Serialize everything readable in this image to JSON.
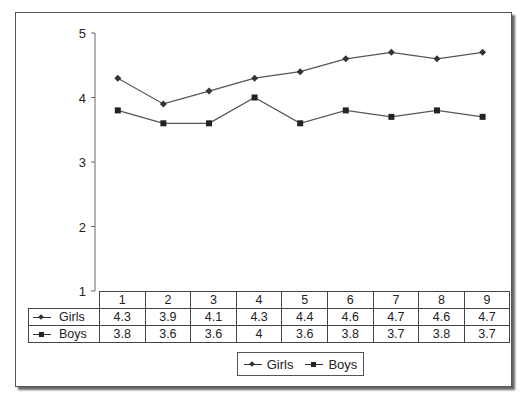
{
  "chart_data": {
    "type": "line",
    "title": "",
    "xlabel": "",
    "ylabel": "",
    "ylim": [
      1,
      5
    ],
    "yticks": [
      1,
      2,
      3,
      4,
      5
    ],
    "categories": [
      "1",
      "2",
      "3",
      "4",
      "5",
      "6",
      "7",
      "8",
      "9"
    ],
    "series": [
      {
        "name": "Girls",
        "marker": "diamond",
        "values": [
          4.3,
          3.9,
          4.1,
          4.3,
          4.4,
          4.6,
          4.7,
          4.6,
          4.7
        ]
      },
      {
        "name": "Boys",
        "marker": "square",
        "values": [
          3.8,
          3.6,
          3.6,
          4,
          3.6,
          3.8,
          3.7,
          3.8,
          3.7
        ]
      }
    ],
    "grid": false,
    "legend_position": "bottom",
    "data_table": true
  },
  "table": {
    "header": [
      "1",
      "2",
      "3",
      "4",
      "5",
      "6",
      "7",
      "8",
      "9"
    ],
    "rows": [
      {
        "label": "Girls",
        "cells": [
          "4.3",
          "3.9",
          "4.1",
          "4.3",
          "4.4",
          "4.6",
          "4.7",
          "4.6",
          "4.7"
        ]
      },
      {
        "label": "Boys",
        "cells": [
          "3.8",
          "3.6",
          "3.6",
          "4",
          "3.6",
          "3.8",
          "3.7",
          "3.8",
          "3.7"
        ]
      }
    ]
  },
  "legend": {
    "items": [
      "Girls",
      "Boys"
    ]
  },
  "colors": {
    "line": "#555555",
    "marker": "#333333",
    "frame": "#555555"
  }
}
